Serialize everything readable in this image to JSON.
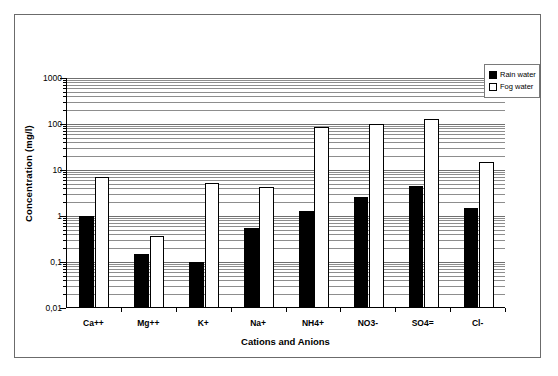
{
  "chart_data": {
    "type": "bar",
    "title": "",
    "xlabel": "Cations and Anions",
    "ylabel": "Concentration (mg/l)",
    "yscale": "log",
    "ylim": [
      0.01,
      1000
    ],
    "ytick_labels": [
      "1000",
      "100",
      "10",
      "1",
      "0,1",
      "0,01"
    ],
    "ytick_values": [
      1000,
      100,
      10,
      1,
      0.1,
      0.01
    ],
    "grid": true,
    "legend_position": "top-right",
    "categories": [
      "Ca++",
      "Mg++",
      "K+",
      "Na+",
      "NH4+",
      "NO3-",
      "SO4=",
      "Cl-"
    ],
    "series": [
      {
        "name": "Rain water",
        "color": "#000000",
        "values": [
          1.0,
          0.15,
          0.1,
          0.55,
          1.3,
          2.6,
          4.5,
          1.5
        ]
      },
      {
        "name": "Fog water",
        "color": "#ffffff",
        "values": [
          7.0,
          0.37,
          5.2,
          4.3,
          85,
          100,
          130,
          15
        ]
      }
    ]
  },
  "legend": {
    "items": [
      {
        "label": "Rain water",
        "swatch": "filled-square-icon"
      },
      {
        "label": "Fog water",
        "swatch": "empty-square-icon"
      }
    ]
  }
}
